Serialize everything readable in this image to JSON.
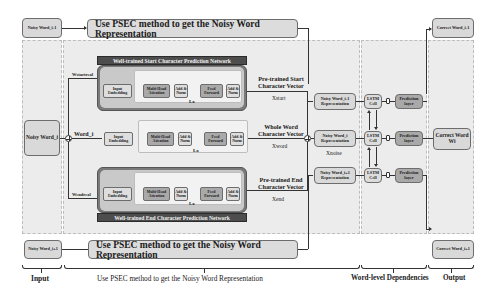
{
  "inputs": {
    "prev": "Noisy Word_i-1",
    "current": "Noisy Word_i",
    "next": "Noisy Word_i+1"
  },
  "psec_bars": {
    "top": "Use PSEC method to get the Noisy Word Representation",
    "bottom": "Use PSEC method to get the Noisy Word Representation"
  },
  "branches": {
    "start_label": "Wstartreal",
    "word_label": "Word_i",
    "end_label": "Wendreal"
  },
  "start_network": {
    "title": "Well-trained Start Character Prediction Network",
    "input_embedding": "Input Embedding",
    "multi_head_attention": "Multi-Head Attention",
    "add_norm_1": "Add & Norm",
    "feed_forward": "Feed Forward",
    "add_norm_2": "Add & Norm",
    "repeat": "Lx",
    "output_label": "Pre-trained Start Character Vector",
    "output_var": "Xstart"
  },
  "word_network": {
    "input_embedding": "Input Embedding",
    "multi_head_attention": "Multi-Head Attention",
    "add_norm_1": "Add & Norm",
    "feed_forward": "Feed Forward",
    "add_norm_2": "Add & Norm",
    "repeat": "Lx",
    "output_label": "Whole Word Character Vector",
    "output_var": "Xword"
  },
  "end_network": {
    "title": "Well-trained End Character Prediction Network",
    "input_embedding": "Input Embedding",
    "multi_head_attention": "Multi-Head Attention",
    "add_norm_1": "Add & Norm",
    "feed_forward": "Feed Forward",
    "add_norm_2": "Add & Norm",
    "repeat": "Lx",
    "output_label": "Pre-trained End Character Vector",
    "output_var": "Xend"
  },
  "representations": {
    "prev": "Noisy Word_i-1 Representation",
    "current": "Noisy Word_i Representation",
    "next": "Noisy Word_i+1 Representation",
    "current_var": "Xnoise"
  },
  "lstm": {
    "cell": "LSTM Cell",
    "prediction": "Prediction layer"
  },
  "outputs": {
    "prev": "Correct Word_i-1",
    "current": "Correct Word Wi",
    "next": "Correct Word_i+1"
  },
  "footer": {
    "input": "Input",
    "psec": "Use PSEC method to get the Noisy Word Representation",
    "word_level": "Word-level Dependencies",
    "output": "Output"
  }
}
